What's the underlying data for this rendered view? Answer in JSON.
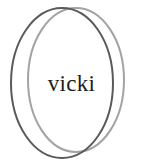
{
  "diagram": {
    "type": "venn-two-ellipse-overlap",
    "background_color": "#ffffff",
    "width": 141,
    "height": 165,
    "center_label": {
      "text": "vicki",
      "color": "#1c1c1c",
      "font_style": "serif"
    },
    "shapes": [
      {
        "name": "outer-dark-ellipse",
        "role": "left-ellipse",
        "stroke_color": "#5a5a5a",
        "stroke_width": 2,
        "fill": "none",
        "cx": 62,
        "cy": 83,
        "rx": 51,
        "ry": 75
      },
      {
        "name": "inner-light-ellipse",
        "role": "right-ellipse",
        "stroke_color": "#a3a3a3",
        "stroke_width": 2,
        "fill": "none",
        "cx": 76,
        "cy": 80,
        "rx": 48,
        "ry": 72
      }
    ]
  }
}
